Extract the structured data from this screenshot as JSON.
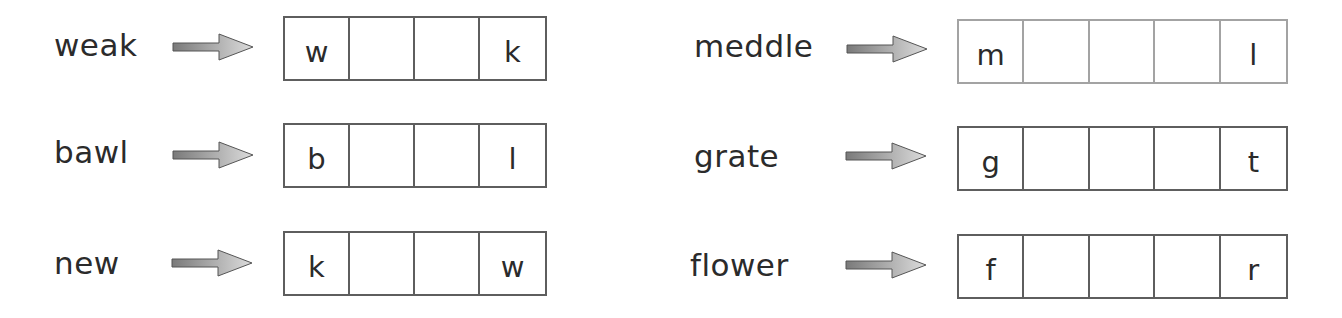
{
  "worksheet": {
    "left_column": [
      {
        "word": "weak",
        "cells": [
          "w",
          "",
          "",
          "k"
        ]
      },
      {
        "word": "bawl",
        "cells": [
          "b",
          "",
          "",
          "l"
        ]
      },
      {
        "word": "new",
        "cells": [
          "k",
          "",
          "",
          "w"
        ]
      }
    ],
    "right_column": [
      {
        "word": "meddle",
        "cells": [
          "m",
          "",
          "",
          "",
          "l"
        ]
      },
      {
        "word": "grate",
        "cells": [
          "g",
          "",
          "",
          "",
          "t"
        ]
      },
      {
        "word": "flower",
        "cells": [
          "f",
          "",
          "",
          "",
          "r"
        ]
      }
    ],
    "arrow_icon": "right-arrow",
    "colors": {
      "text": "#2b2b2b",
      "box_border": "#5e5e5e",
      "box_border_light": "#a3a3a3",
      "arrow_dark": "#7a7a7a",
      "arrow_light": "#d6d6d6"
    }
  }
}
